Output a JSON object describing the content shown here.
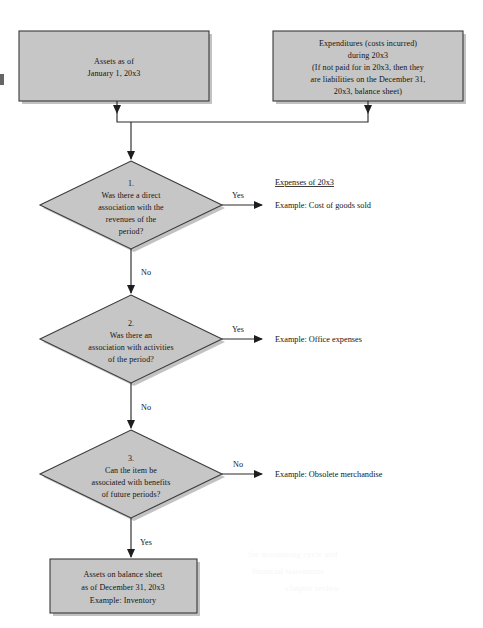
{
  "diagram": {
    "colors": {
      "shape_fill": "#c6c6c6",
      "shape_border": "#3a3a3a",
      "connector": "#2b2b2b",
      "text": "#141414",
      "page_background": "#ffffff"
    },
    "inputs": [
      {
        "id": "assets-box",
        "lines": [
          "Assets as of",
          "January 1, 20x3"
        ]
      },
      {
        "id": "expenditures-box",
        "lines": [
          "Expenditures (costs incurred)",
          "during 20x3",
          "(If not paid for in 20x3, then they",
          "are liabilities on the December 31,",
          "20x3, balance sheet)"
        ]
      }
    ],
    "decisions": [
      {
        "id": "decision-1",
        "number": "1.",
        "lines": [
          "Was there a direct",
          "association with the",
          "revenues of the",
          "period?"
        ],
        "branch_right_label": "Yes",
        "branch_down_label": "No"
      },
      {
        "id": "decision-2",
        "number": "2.",
        "lines": [
          "Was there an",
          "association with activities",
          "of the period?"
        ],
        "branch_right_label": "Yes",
        "branch_down_label": "No"
      },
      {
        "id": "decision-3",
        "number": "3.",
        "lines": [
          "Can the item be",
          "associated with benefits",
          "of future periods?"
        ],
        "branch_right_label": "No",
        "branch_down_label": "Yes"
      }
    ],
    "outcomes": [
      {
        "id": "outcome-1",
        "heading": "Expenses of 20x3",
        "example": "Example: Cost of goods sold"
      },
      {
        "id": "outcome-2",
        "heading": "",
        "example": "Example: Office expenses"
      },
      {
        "id": "outcome-3",
        "heading": "",
        "example": "Example: Obsolete merchandise"
      }
    ],
    "terminal": {
      "id": "assets-balance-sheet-box",
      "lines": [
        "Assets on balance sheet",
        "as of December 31, 20x3",
        "Example: Inventory"
      ]
    }
  }
}
